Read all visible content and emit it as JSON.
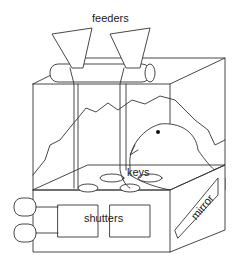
{
  "diagram": {
    "labels": {
      "feeders": "feeders",
      "keys": "keys",
      "shutters": "shutters",
      "mirror": "mirror"
    },
    "colors": {
      "line": "#333333",
      "background": "#ffffff"
    }
  }
}
